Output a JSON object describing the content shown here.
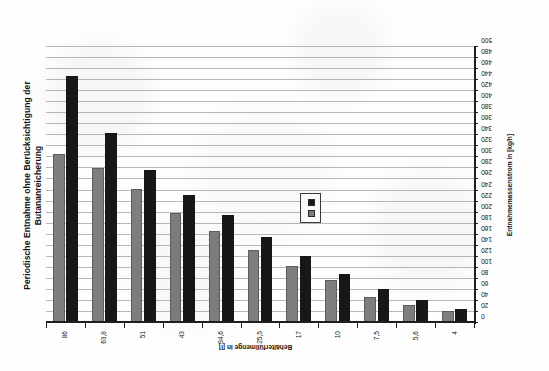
{
  "chart_data": {
    "type": "bar",
    "orientation": "horizontal",
    "title": "Periodische Entnahme ohne Berücksichtigung der Butananreicherung",
    "title_line1": "Periodische Entnahme ohne Berücksichtigung der",
    "title_line2": "Butananreicherung",
    "xlabel": "Entnahmemassenstrom in [kg/h]",
    "ylabel": "Behälterfüllmenge in [l]",
    "categories": [
      "4",
      "5,6",
      "7,5",
      "10",
      "17",
      "25,5",
      "34,6",
      "43",
      "51",
      "63,8",
      "86"
    ],
    "xlim": [
      0,
      500
    ],
    "xticks": [
      0,
      20,
      40,
      60,
      80,
      100,
      120,
      140,
      160,
      180,
      200,
      220,
      240,
      260,
      280,
      300,
      320,
      340,
      360,
      380,
      400,
      420,
      440,
      460,
      480,
      500
    ],
    "grid": true,
    "legend_position": "top-center",
    "series": [
      {
        "name": "Serie 1",
        "color": "#7e7e7e",
        "legend_label": "",
        "values": [
          22,
          32,
          47,
          78,
          104,
          132,
          167,
          200,
          243,
          281,
          306
        ]
      },
      {
        "name": "Serie 2",
        "color": "#171717",
        "legend_label": "",
        "values": [
          26,
          42,
          62,
          88,
          122,
          155,
          196,
          231,
          277,
          345,
          447
        ]
      }
    ]
  },
  "legend": {
    "items": [
      {
        "swatch_color": "#7e7e7e",
        "label": ""
      },
      {
        "swatch_color": "#171717",
        "label": ""
      }
    ]
  }
}
